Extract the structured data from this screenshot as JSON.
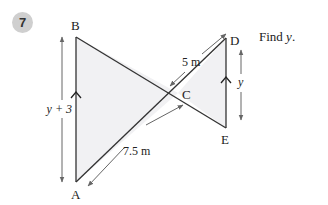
{
  "question": {
    "number": "7",
    "prompt_prefix": "Find ",
    "prompt_var": "y",
    "prompt_suffix": "."
  },
  "diagram": {
    "points": {
      "A": "A",
      "B": "B",
      "C": "C",
      "D": "D",
      "E": "E"
    },
    "labels": {
      "AB_length": "y + 3",
      "DE_length": "y",
      "AC_length": "7.5 m",
      "CD_length": "5 m"
    },
    "colors": {
      "fill": "#f1f1f3",
      "line": "#333333",
      "dimension": "#666666",
      "badge": "#cfcfcf"
    }
  }
}
